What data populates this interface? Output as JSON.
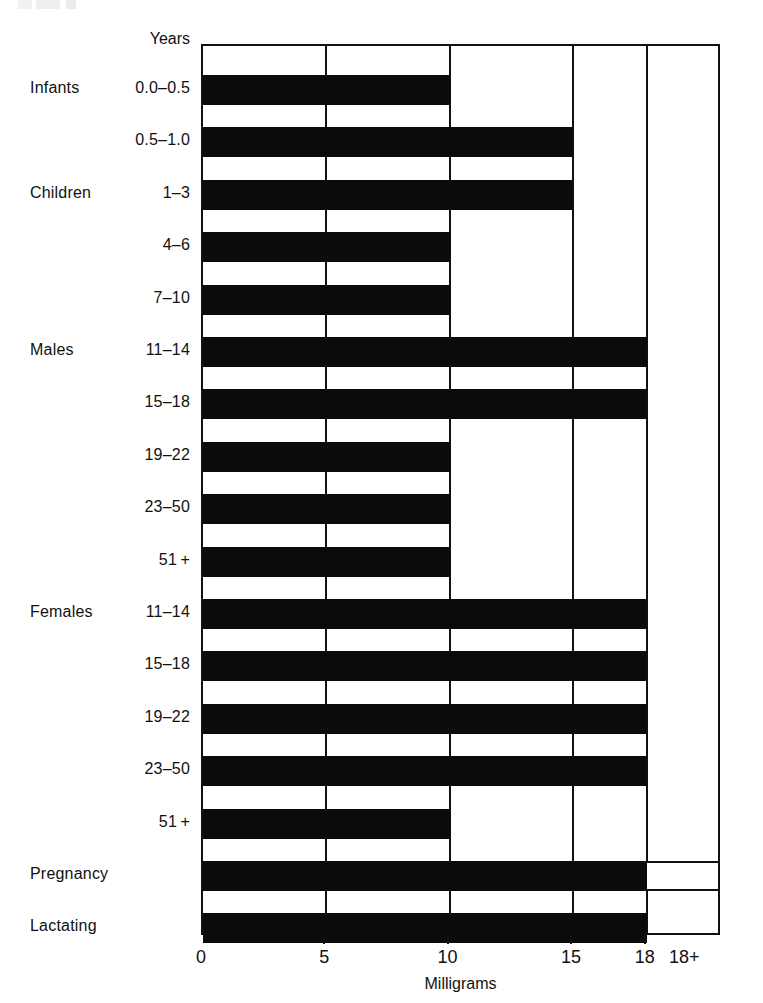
{
  "axis": {
    "y_header": "Years",
    "x_title": "Milligrams",
    "ticks": [
      {
        "label": "0",
        "value": 0
      },
      {
        "label": "5",
        "value": 5
      },
      {
        "label": "10",
        "value": 10
      },
      {
        "label": "15",
        "value": 15
      },
      {
        "label": "18",
        "value": 18
      },
      {
        "label": "18+",
        "value": 19.6
      }
    ]
  },
  "groups": [
    {
      "label": "Infants"
    },
    {
      "label": "Children"
    },
    {
      "label": "Males"
    },
    {
      "label": "Females"
    },
    {
      "label": "Pregnancy"
    },
    {
      "label": "Lactating"
    }
  ],
  "rows": [
    {
      "group": "Infants",
      "age": "0.0–0.5",
      "value": 10,
      "open_ended": false
    },
    {
      "group": "",
      "age": "0.5–1.0",
      "value": 15,
      "open_ended": false
    },
    {
      "group": "Children",
      "age": "1–3",
      "value": 15,
      "open_ended": false
    },
    {
      "group": "",
      "age": "4–6",
      "value": 10,
      "open_ended": false
    },
    {
      "group": "",
      "age": "7–10",
      "value": 10,
      "open_ended": false
    },
    {
      "group": "Males",
      "age": "11–14",
      "value": 18,
      "open_ended": false
    },
    {
      "group": "",
      "age": "15–18",
      "value": 18,
      "open_ended": false
    },
    {
      "group": "",
      "age": "19–22",
      "value": 10,
      "open_ended": false
    },
    {
      "group": "",
      "age": "23–50",
      "value": 10,
      "open_ended": false
    },
    {
      "group": "",
      "age": "51 +",
      "value": 10,
      "open_ended": false
    },
    {
      "group": "Females",
      "age": "11–14",
      "value": 18,
      "open_ended": false
    },
    {
      "group": "",
      "age": "15–18",
      "value": 18,
      "open_ended": false
    },
    {
      "group": "",
      "age": "19–22",
      "value": 18,
      "open_ended": false
    },
    {
      "group": "",
      "age": "23–50",
      "value": 18,
      "open_ended": false
    },
    {
      "group": "",
      "age": "51 +",
      "value": 10,
      "open_ended": false
    },
    {
      "group": "Pregnancy",
      "age": "",
      "value": 18,
      "open_ended": true
    },
    {
      "group": "Lactating",
      "age": "",
      "value": 18,
      "open_ended": false
    }
  ],
  "colors": {
    "bar": "#0b0b0b",
    "axis": "#111111",
    "background": "#ffffff"
  },
  "chart_data": {
    "type": "bar",
    "orientation": "horizontal",
    "title": "",
    "subtitle": "",
    "xlabel": "Milligrams",
    "ylabel": "Years",
    "xlim": [
      0,
      19.6
    ],
    "xticks": [
      0,
      5,
      10,
      15,
      18
    ],
    "xticklabels": [
      "0",
      "5",
      "10",
      "15",
      "18",
      "18+"
    ],
    "grid": true,
    "legend": null,
    "categories": [
      "Infants 0.0–0.5",
      "0.5–1.0",
      "Children 1–3",
      "4–6",
      "7–10",
      "Males 11–14",
      "15–18",
      "19–22",
      "23–50",
      "51+",
      "Females 11–14",
      "15–18",
      "19–22",
      "23–50",
      "51+",
      "Pregnancy",
      "Lactating"
    ],
    "values": [
      10,
      15,
      15,
      10,
      10,
      18,
      18,
      10,
      10,
      10,
      18,
      18,
      18,
      18,
      10,
      18,
      18
    ],
    "annotations": [
      {
        "category": "Pregnancy",
        "note": "18+ (open-ended, extends beyond 18)"
      }
    ]
  }
}
